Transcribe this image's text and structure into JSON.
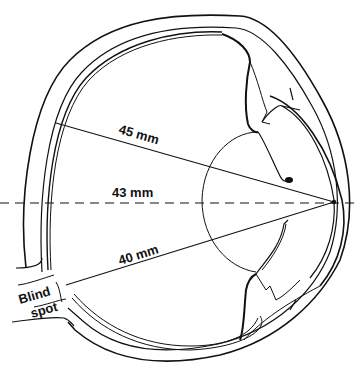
{
  "diagram": {
    "colors": {
      "ink": "#111111",
      "background": "#ffffff"
    },
    "labels": {
      "line_top": "45 mm",
      "line_middle": "43 mm",
      "line_bottom": "40 mm",
      "blind_spot_line1": "Blind",
      "blind_spot_line2": "spot"
    },
    "measurements": [
      {
        "label": "45 mm",
        "style": "solid",
        "direction": "upper"
      },
      {
        "label": "43 mm",
        "style": "dashed",
        "direction": "optical-axis"
      },
      {
        "label": "40 mm",
        "style": "solid",
        "direction": "lower"
      }
    ]
  }
}
